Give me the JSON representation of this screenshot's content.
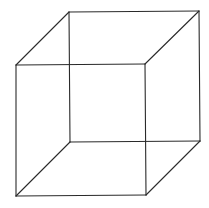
{
  "figure": {
    "stroke_color": "#2a2a2a",
    "background": "#ffffff",
    "vertices": {
      "front_top_left": [
        16,
        65
      ],
      "front_top_right": [
        145,
        64
      ],
      "front_bottom_right": [
        146,
        195
      ],
      "front_bottom_left": [
        16,
        196
      ],
      "back_top_left": [
        69,
        12
      ],
      "back_top_right": [
        199,
        11
      ],
      "back_bottom_right": [
        200,
        141
      ],
      "back_bottom_left": [
        70,
        142
      ]
    }
  }
}
